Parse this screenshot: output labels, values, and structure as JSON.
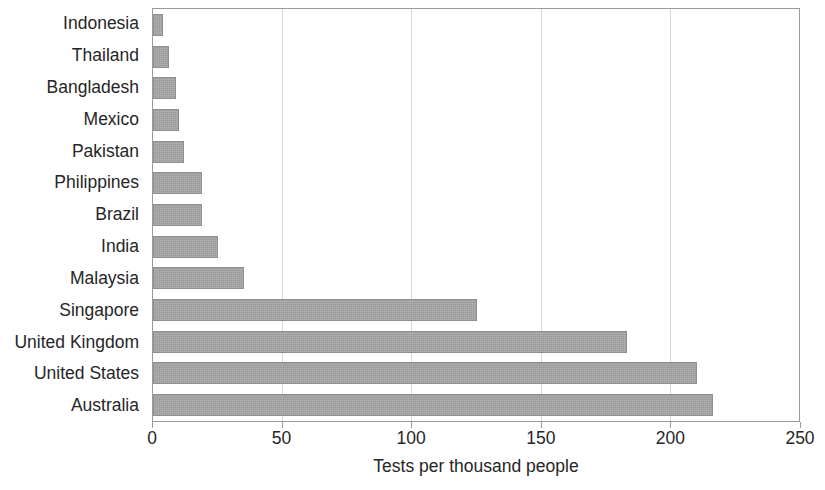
{
  "chart_data": {
    "type": "bar",
    "orientation": "horizontal",
    "title": "",
    "xlabel": "Tests per thousand people",
    "ylabel": "",
    "xlim": [
      0,
      250
    ],
    "xticks": [
      "0",
      "50",
      "100",
      "150",
      "200",
      "250"
    ],
    "xtick_values": [
      0,
      50,
      100,
      150,
      200,
      250
    ],
    "grid": "vertical",
    "legend": "none",
    "bar_color": "#a6a6a6",
    "bar_border_color": "#8f8f8f",
    "gridline_color": "#d9d9d9",
    "axis_color": "#9a9a9a",
    "categories": [
      "Indonesia",
      "Thailand",
      "Bangladesh",
      "Mexico",
      "Pakistan",
      "Philippines",
      "Brazil",
      "India",
      "Malaysia",
      "Singapore",
      "United Kingdom",
      "United States",
      "Australia"
    ],
    "values": [
      4,
      6,
      9,
      10,
      12,
      19,
      19,
      25,
      35,
      125,
      183,
      210,
      216
    ]
  }
}
